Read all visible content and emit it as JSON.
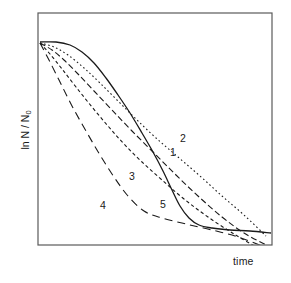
{
  "chart_data": {
    "type": "line",
    "title": "",
    "subtitle": "",
    "xlabel": "time",
    "ylabel": "ln N / N",
    "ylabel_sub": "0",
    "xlim": [
      0,
      100
    ],
    "ylim": [
      -100,
      0
    ],
    "grid": false,
    "legend_position": "inline-labels",
    "axis_ticks": {
      "x": [],
      "y": []
    },
    "frame": {
      "left": 38,
      "top": 13,
      "right": 272,
      "bottom": 245,
      "color": "#5a5a5a",
      "width": 1.2
    },
    "annotations": [
      {
        "label": "1",
        "x": 170,
        "y": 147
      },
      {
        "label": "2",
        "x": 180,
        "y": 133
      },
      {
        "label": "3",
        "x": 129,
        "y": 171
      },
      {
        "label": "4",
        "x": 100,
        "y": 200
      },
      {
        "label": "5",
        "x": 160,
        "y": 199
      }
    ],
    "series": [
      {
        "name": "1",
        "style": "dashed",
        "dash": "6,3",
        "color": "#1a1a1a",
        "width": 1.1,
        "description": "shoulder then log-linear decline, moderate rate",
        "points": [
          [
            40,
            43
          ],
          [
            52,
            50
          ],
          [
            64,
            60
          ],
          [
            78,
            74
          ],
          [
            94,
            91
          ],
          [
            112,
            110
          ],
          [
            132,
            131
          ],
          [
            154,
            153
          ],
          [
            176,
            175
          ],
          [
            198,
            196
          ],
          [
            222,
            217
          ],
          [
            244,
            233
          ],
          [
            266,
            245
          ]
        ]
      },
      {
        "name": "2",
        "style": "dotted",
        "dash": "1.6,2.6",
        "color": "#1a1a1a",
        "width": 1.1,
        "description": "concave shoulder, slowest overall decline with tail",
        "points": [
          [
            40,
            43
          ],
          [
            54,
            47
          ],
          [
            68,
            55
          ],
          [
            84,
            68
          ],
          [
            100,
            83
          ],
          [
            118,
            101
          ],
          [
            136,
            119
          ],
          [
            156,
            138
          ],
          [
            178,
            157
          ],
          [
            200,
            176
          ],
          [
            222,
            196
          ],
          [
            244,
            215
          ],
          [
            266,
            236
          ]
        ]
      },
      {
        "name": "3",
        "style": "short-dashed",
        "dash": "3.4,2.6",
        "color": "#1a1a1a",
        "width": 1.1,
        "description": "near log-linear decline, steeper than 1 and 2",
        "points": [
          [
            40,
            43
          ],
          [
            50,
            54
          ],
          [
            62,
            69
          ],
          [
            76,
            87
          ],
          [
            92,
            107
          ],
          [
            108,
            126
          ],
          [
            124,
            144
          ],
          [
            142,
            162
          ],
          [
            162,
            180
          ],
          [
            184,
            199
          ],
          [
            208,
            217
          ],
          [
            234,
            234
          ],
          [
            258,
            248
          ]
        ]
      },
      {
        "name": "4",
        "style": "long-dashed",
        "dash": "8,5",
        "color": "#1a1a1a",
        "width": 1.1,
        "description": "fastest initial decline then pronounced tailing",
        "points": [
          [
            40,
            43
          ],
          [
            49,
            60
          ],
          [
            60,
            82
          ],
          [
            72,
            106
          ],
          [
            86,
            131
          ],
          [
            100,
            155
          ],
          [
            114,
            177
          ],
          [
            128,
            196
          ],
          [
            144,
            211
          ],
          [
            162,
            218
          ],
          [
            186,
            224
          ],
          [
            212,
            230
          ],
          [
            238,
            237
          ],
          [
            262,
            246
          ]
        ]
      },
      {
        "name": "5",
        "style": "solid",
        "dash": "",
        "color": "#1a1a1a",
        "width": 1.3,
        "description": "sigmoidal: flat shoulder, steep log-linear phase, long flat tail",
        "points": [
          [
            40,
            42
          ],
          [
            56,
            42
          ],
          [
            70,
            45
          ],
          [
            82,
            52
          ],
          [
            94,
            63
          ],
          [
            106,
            78
          ],
          [
            118,
            95
          ],
          [
            130,
            113
          ],
          [
            142,
            133
          ],
          [
            153,
            152
          ],
          [
            163,
            171
          ],
          [
            172,
            190
          ],
          [
            180,
            206
          ],
          [
            189,
            218
          ],
          [
            199,
            225
          ],
          [
            212,
            228
          ],
          [
            230,
            230
          ],
          [
            250,
            231
          ],
          [
            271,
            233
          ]
        ]
      }
    ]
  },
  "figure": {
    "background": "#ffffff",
    "text_color": "#1a1a1a"
  }
}
